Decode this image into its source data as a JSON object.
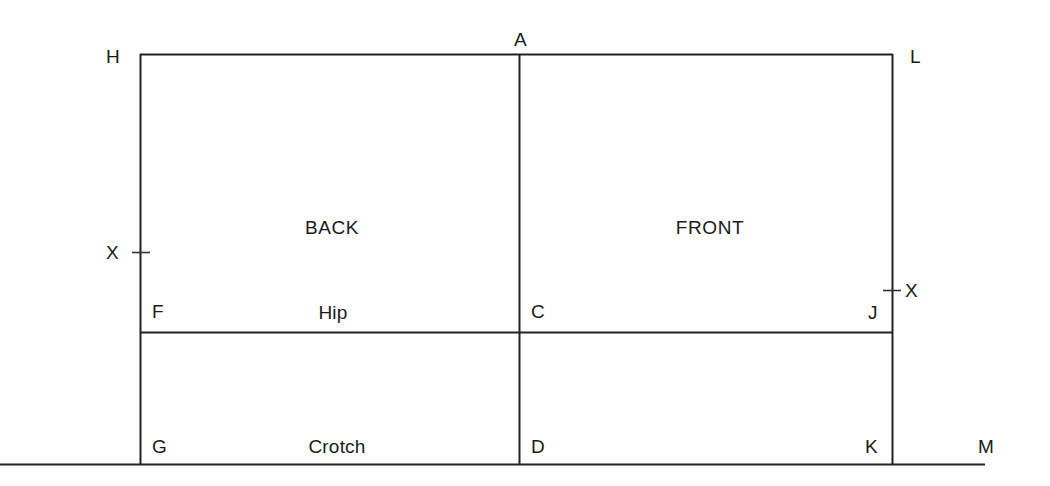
{
  "diagram": {
    "type": "pattern-draft",
    "colors": {
      "line": "#222222",
      "text": "#1a1a1a",
      "background": "#ffffff"
    },
    "regions": [
      {
        "id": "back",
        "label": "BACK",
        "x": 332,
        "y": 228
      },
      {
        "id": "front",
        "label": "FRONT",
        "x": 710,
        "y": 228
      }
    ],
    "measure_lines": [
      {
        "id": "hip",
        "label": "Hip",
        "x": 333,
        "y": 313
      },
      {
        "id": "crotch",
        "label": "Crotch",
        "x": 337,
        "y": 447
      }
    ],
    "points": [
      {
        "id": "H",
        "label": "H",
        "x": 112,
        "y": 47
      },
      {
        "id": "A",
        "label": "A",
        "x": 521,
        "y": 30
      },
      {
        "id": "L",
        "label": "L",
        "x": 915,
        "y": 47
      },
      {
        "id": "X-left",
        "label": "X",
        "x": 112,
        "y": 243
      },
      {
        "id": "X-right",
        "label": "X",
        "x": 907,
        "y": 281
      },
      {
        "id": "F",
        "label": "F",
        "x": 155,
        "y": 302
      },
      {
        "id": "C",
        "label": "C",
        "x": 534,
        "y": 302
      },
      {
        "id": "J",
        "label": "J",
        "x": 870,
        "y": 303
      },
      {
        "id": "G",
        "label": "G",
        "x": 157,
        "y": 437
      },
      {
        "id": "D",
        "label": "D",
        "x": 535,
        "y": 437
      },
      {
        "id": "K",
        "label": "K",
        "x": 869,
        "y": 437
      },
      {
        "id": "M",
        "label": "M",
        "x": 982,
        "y": 437
      }
    ],
    "geometry": {
      "rect": {
        "left": 140,
        "top": 54,
        "right": 893,
        "bottom": 464
      },
      "center_line_x": 519,
      "hip_line_y": 332,
      "baseline_y": 464,
      "baseline_left": 0,
      "baseline_right": 985,
      "tick_left": {
        "x": 140,
        "y": 252,
        "half_width": 8
      },
      "tick_right": {
        "x": 893,
        "y": 290,
        "half_width": 8
      }
    }
  }
}
